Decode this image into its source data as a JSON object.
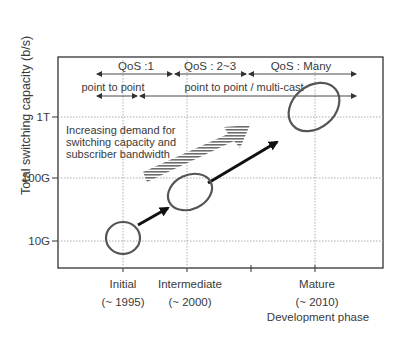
{
  "diagram": {
    "y_axis_label": "Total switching capacity (b/s)",
    "y_ticks": [
      {
        "label": "1T",
        "level": 1
      },
      {
        "label": "100G",
        "level": 2
      },
      {
        "label": "10G",
        "level": 3
      }
    ],
    "x_categories": [
      {
        "name": "Initial",
        "period": "(~ 1995)"
      },
      {
        "name": "Intermediate",
        "period": "(~ 2000)"
      },
      {
        "name": "Mature",
        "period": "(~ 2010)"
      }
    ],
    "x_axis_label": "Development phase",
    "qos_ranges": [
      {
        "label": "QoS :1"
      },
      {
        "label": "QoS : 2~3"
      },
      {
        "label": "QoS : Many"
      }
    ],
    "connection_ranges": [
      {
        "label": "point to point"
      },
      {
        "label": "point to point / multi-cast"
      }
    ],
    "annotation": {
      "line1": "Increasing demand for",
      "line2": "switching capacity and",
      "line3": "subscriber bandwidth"
    },
    "colors": {
      "ellipse": "#555555",
      "arrow": "#1a1a1a",
      "grid": "#999999",
      "stripe": "#777777"
    }
  }
}
